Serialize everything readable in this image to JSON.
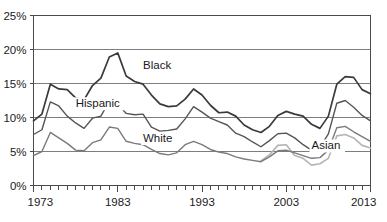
{
  "chart_data": {
    "type": "line",
    "title": "",
    "xlabel": "",
    "ylabel": "",
    "xlim": [
      1973,
      2013
    ],
    "ylim": [
      0,
      25
    ],
    "y_tick_labels": [
      "0%",
      "5%",
      "10%",
      "15%",
      "20%",
      "25%"
    ],
    "y_tick_values": [
      0,
      5,
      10,
      15,
      20,
      25
    ],
    "x_tick_labels": [
      "1973",
      "1983",
      "1993",
      "2003",
      "2013"
    ],
    "x_tick_values": [
      1973,
      1983,
      1993,
      2003,
      2013
    ],
    "x_minor_tick_step": 1,
    "grid": "horizontal",
    "legend_position": "inline-annotations",
    "x": [
      1973,
      1974,
      1975,
      1976,
      1977,
      1978,
      1979,
      1980,
      1981,
      1982,
      1983,
      1984,
      1985,
      1986,
      1987,
      1988,
      1989,
      1990,
      1991,
      1992,
      1993,
      1994,
      1995,
      1996,
      1997,
      1998,
      1999,
      2000,
      2001,
      2002,
      2003,
      2004,
      2005,
      2006,
      2007,
      2008,
      2009,
      2010,
      2011,
      2012,
      2013
    ],
    "series": [
      {
        "name": "Black",
        "color": "#3a3a3a",
        "width": 1.7,
        "label_x": 1986,
        "label_y": 17.2,
        "values": [
          9.5,
          10.5,
          14.9,
          14.2,
          14.1,
          12.9,
          12.6,
          14.7,
          15.8,
          18.9,
          19.5,
          16.1,
          15.3,
          14.9,
          13.3,
          12.0,
          11.6,
          11.7,
          12.7,
          14.2,
          13.3,
          11.8,
          10.7,
          10.8,
          10.2,
          8.9,
          8.2,
          7.8,
          8.7,
          10.3,
          10.9,
          10.5,
          10.2,
          9.0,
          8.4,
          10.2,
          14.9,
          16.0,
          15.9,
          14.1,
          13.5
        ]
      },
      {
        "name": "Hispanic",
        "color": "#555555",
        "width": 1.4,
        "label_x": 1978,
        "label_y": 11.5,
        "values": [
          7.5,
          8.2,
          12.3,
          11.7,
          10.2,
          9.2,
          8.4,
          9.9,
          10.2,
          12.4,
          12.0,
          10.6,
          10.4,
          10.5,
          8.6,
          8.0,
          8.1,
          8.3,
          9.8,
          11.6,
          10.8,
          9.9,
          9.4,
          8.9,
          7.7,
          7.2,
          6.4,
          5.7,
          6.6,
          7.6,
          7.7,
          7.0,
          6.0,
          5.2,
          5.6,
          7.6,
          12.1,
          12.5,
          11.5,
          10.3,
          9.5
        ]
      },
      {
        "name": "White",
        "color": "#7a7a7a",
        "width": 1.4,
        "label_x": 1986,
        "label_y": 6.4,
        "values": [
          4.4,
          5.0,
          7.8,
          7.0,
          6.2,
          5.2,
          5.1,
          6.3,
          6.7,
          8.6,
          8.4,
          6.5,
          6.2,
          6.0,
          5.3,
          4.7,
          4.5,
          4.8,
          6.0,
          6.5,
          6.0,
          5.3,
          4.9,
          4.7,
          4.2,
          3.9,
          3.7,
          3.5,
          4.2,
          5.1,
          5.2,
          4.8,
          4.4,
          4.0,
          4.1,
          5.2,
          8.5,
          8.7,
          7.9,
          7.2,
          6.5
        ]
      },
      {
        "name": "Asian",
        "color": "#b5b5b5",
        "width": 1.6,
        "label_x": 2006,
        "label_y": 5.3,
        "start_index": 27,
        "values": [
          null,
          null,
          null,
          null,
          null,
          null,
          null,
          null,
          null,
          null,
          null,
          null,
          null,
          null,
          null,
          null,
          null,
          null,
          null,
          null,
          null,
          null,
          null,
          null,
          null,
          null,
          null,
          3.6,
          4.5,
          5.9,
          6.0,
          4.4,
          4.0,
          3.0,
          3.2,
          4.0,
          7.3,
          7.5,
          7.0,
          5.9,
          5.5
        ]
      }
    ]
  }
}
